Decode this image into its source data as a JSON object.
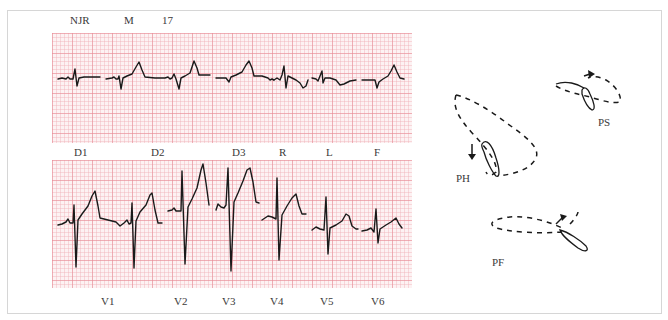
{
  "header": {
    "patient_id": "NJR",
    "sex": "M",
    "age": "17"
  },
  "ecg": {
    "grid_color": "#fdf2f3",
    "trace_color": "#1a1a1a",
    "limb_leads": [
      {
        "label": "D1"
      },
      {
        "label": "D2"
      },
      {
        "label": "D3"
      },
      {
        "label": "R"
      },
      {
        "label": "L"
      },
      {
        "label": "F"
      }
    ],
    "precordial_leads": [
      {
        "label": "V1"
      },
      {
        "label": "V2"
      },
      {
        "label": "V3"
      },
      {
        "label": "V4"
      },
      {
        "label": "V5"
      },
      {
        "label": "V6"
      }
    ]
  },
  "vectorcardiogram": {
    "planes": [
      {
        "label": "PH"
      },
      {
        "label": "PS"
      },
      {
        "label": "PF"
      }
    ]
  }
}
